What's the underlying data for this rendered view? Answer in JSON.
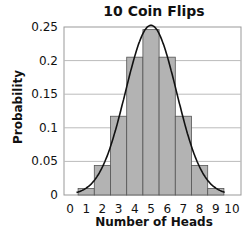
{
  "chart_data": {
    "type": "bar",
    "title": "10 Coin Flips",
    "xlabel": "Number of Heads",
    "ylabel": "Probability",
    "x_ticks": [
      "0",
      "1",
      "2",
      "3",
      "4",
      "5",
      "6",
      "7",
      "8",
      "9",
      "10"
    ],
    "y_ticks": [
      "0",
      "0.05",
      "0.1",
      "0.15",
      "0.2",
      "0.25"
    ],
    "ylim": [
      0,
      0.25
    ],
    "xlim": [
      -0.4,
      10.4
    ],
    "grid": "horizontal",
    "categories": [
      0,
      1,
      2,
      3,
      4,
      5,
      6,
      7,
      8,
      9,
      10
    ],
    "values": [
      0.001,
      0.0098,
      0.0439,
      0.1172,
      0.2051,
      0.2461,
      0.2051,
      0.1172,
      0.0439,
      0.0098,
      0.001
    ],
    "overlay": {
      "type": "line",
      "name": "normal approximation curve",
      "mean": 5,
      "sd": 1.58
    },
    "colors": {
      "bar_fill": "#b3b3b3",
      "bar_stroke": "#555555",
      "curve": "#111111",
      "grid": "#bbbbbb"
    }
  }
}
